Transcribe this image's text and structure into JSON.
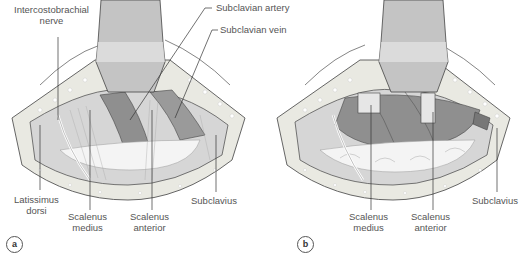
{
  "figure": {
    "panels": [
      {
        "id": "a",
        "badge": "a",
        "labels": {
          "intercostobrachial": "Intercostobrachial\nnerve",
          "intercostobrachial_l1": "Intercostobrachial",
          "intercostobrachial_l2": "nerve",
          "subclavian_artery": "Subclavian artery",
          "subclavian_vein": "Subclavian vein",
          "latissimus_l1": "Latissimus",
          "latissimus_l2": "dorsi",
          "scalenus_medius_l1": "Scalenus",
          "scalenus_medius_l2": "medius",
          "scalenus_anterior_l1": "Scalenus",
          "scalenus_anterior_l2": "anterior",
          "subclavius": "Subclavius"
        }
      },
      {
        "id": "b",
        "badge": "b",
        "labels": {
          "scalenus_medius_l1": "Scalenus",
          "scalenus_medius_l2": "medius",
          "scalenus_anterior_l1": "Scalenus",
          "scalenus_anterior_l2": "anterior",
          "subclavius": "Subclavius"
        }
      }
    ],
    "colors": {
      "vessel": "#8a8a8a",
      "muscle": "#d4d4d4",
      "fat": "#e9e9e2",
      "retractor": "#bdbdbd",
      "label": "#555555"
    }
  }
}
